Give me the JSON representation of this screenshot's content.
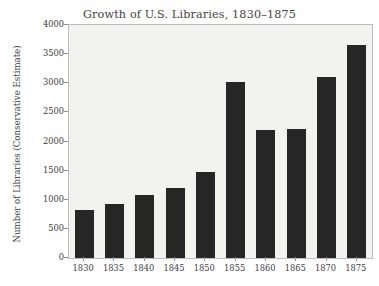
{
  "chart_data": {
    "type": "bar",
    "title": "Growth of U.S. Libraries, 1830–1875",
    "xlabel": "",
    "ylabel": "Number of Libraries (Conservative Estimate)",
    "categories": [
      "1830",
      "1835",
      "1840",
      "1845",
      "1850",
      "1855",
      "1860",
      "1865",
      "1870",
      "1875"
    ],
    "values": [
      820,
      930,
      1080,
      1200,
      1470,
      3020,
      2190,
      2210,
      3110,
      3660
    ],
    "ylim": [
      0,
      4000
    ],
    "yticks": [
      "0",
      "500",
      "1000",
      "1500",
      "2000",
      "2500",
      "3000",
      "3500",
      "4000"
    ],
    "ytick_values": [
      0,
      500,
      1000,
      1500,
      2000,
      2500,
      3000,
      3500,
      4000
    ],
    "grid": false,
    "legend": null,
    "bar_color": "#262626",
    "plot_background": "#f2f2f0",
    "figure_background": "#ffffff",
    "axis_color": "#bdbdbd",
    "text_color": "#3d3d3d"
  }
}
